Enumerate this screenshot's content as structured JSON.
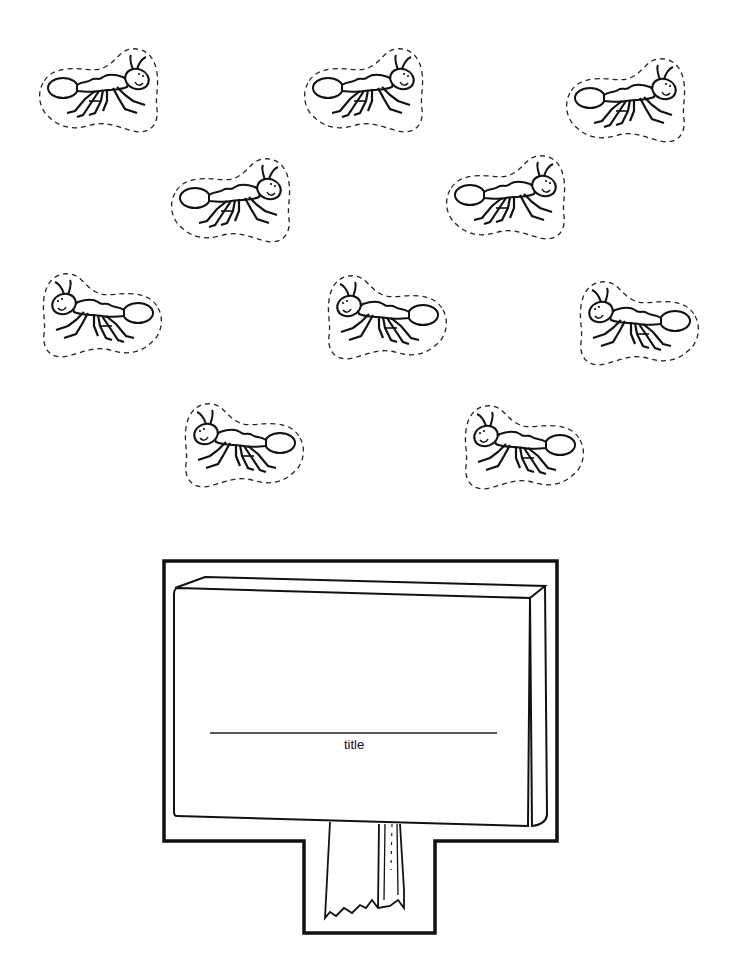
{
  "ants": [
    {
      "id": "ant-1",
      "x": 33,
      "y": 43,
      "facing": "right"
    },
    {
      "id": "ant-2",
      "x": 298,
      "y": 43,
      "facing": "right"
    },
    {
      "id": "ant-3",
      "x": 560,
      "y": 53,
      "facing": "right"
    },
    {
      "id": "ant-4",
      "x": 165,
      "y": 153,
      "facing": "right"
    },
    {
      "id": "ant-5",
      "x": 440,
      "y": 150,
      "facing": "right"
    },
    {
      "id": "ant-6",
      "x": 36,
      "y": 268,
      "facing": "left"
    },
    {
      "id": "ant-7",
      "x": 321,
      "y": 270,
      "facing": "left"
    },
    {
      "id": "ant-8",
      "x": 573,
      "y": 276,
      "facing": "left"
    },
    {
      "id": "ant-9",
      "x": 178,
      "y": 398,
      "facing": "left"
    },
    {
      "id": "ant-10",
      "x": 458,
      "y": 400,
      "facing": "left"
    }
  ],
  "sign": {
    "title_label": "title",
    "line_color": "#111111",
    "background": "#ffffff"
  }
}
